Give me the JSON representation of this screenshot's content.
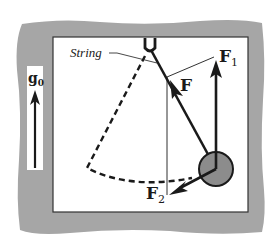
{
  "diagram": {
    "type": "physics-free-body-diagram",
    "labels": {
      "string": "String",
      "gravity": "g",
      "gravity_subscript": "0",
      "force": "F",
      "force1": "F",
      "force1_subscript": "1",
      "force2": "F",
      "force2_subscript": "2"
    },
    "colors": {
      "frame": "#a6a6a6",
      "panel": "#ffffff",
      "ink": "#1a1a1a",
      "bob": "#8c8c8c"
    }
  }
}
